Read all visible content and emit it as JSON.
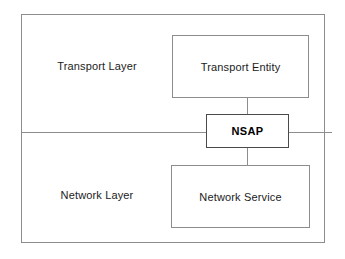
{
  "diagram": {
    "type": "block-diagram",
    "background_color": "#ffffff",
    "line_color": "#8d8d8d",
    "text_color": "#1b1b1b",
    "layers": [
      {
        "id": "transport",
        "label": "Transport Layer",
        "node": {
          "id": "transport-entity",
          "label": "Transport Entity"
        }
      },
      {
        "id": "network",
        "label": "Network Layer",
        "node": {
          "id": "network-service",
          "label": "Network Service"
        }
      }
    ],
    "access_point": {
      "id": "nsap",
      "label": "NSAP",
      "emphasis": "bold",
      "border_color": "#4a4a4a"
    }
  }
}
